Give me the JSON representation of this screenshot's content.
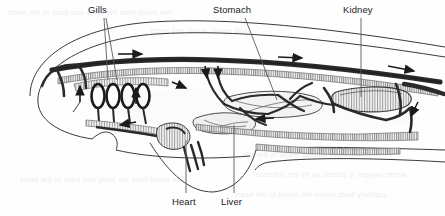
{
  "figure": {
    "background_color": "#fefefe",
    "ink_color": "#1b1b1b",
    "vessel_color": "#2a2a2a",
    "hatch_color": "#8a8a8a",
    "ghost_text_color": "#ededf0"
  },
  "labels": [
    {
      "id": "gills",
      "text": "Gills",
      "x": 88,
      "y": 5,
      "leader": "double-v"
    },
    {
      "id": "stomach",
      "text": "Stomach",
      "x": 213,
      "y": 5,
      "leader": "diagonal"
    },
    {
      "id": "kidney",
      "text": "Kidney",
      "x": 343,
      "y": 5,
      "leader": "vertical"
    },
    {
      "id": "heart",
      "text": "Heart",
      "x": 172,
      "y": 198,
      "leader": "vertical"
    },
    {
      "id": "liver",
      "text": "Liver",
      "x": 221,
      "y": 198,
      "leader": "vertical"
    }
  ],
  "flow_arrows": [
    {
      "id": "dorsal-anterior",
      "direction": "right",
      "x": 130,
      "y": 54
    },
    {
      "id": "dorsal-posterior",
      "direction": "right",
      "x": 292,
      "y": 57
    },
    {
      "id": "caudal-dorsal",
      "direction": "right",
      "x": 404,
      "y": 69
    },
    {
      "id": "gill-ascending",
      "direction": "up",
      "x": 81,
      "y": 90
    },
    {
      "id": "gill-arch-up",
      "direction": "up",
      "x": 136,
      "y": 90
    },
    {
      "id": "efferent-branch",
      "direction": "down-right",
      "x": 186,
      "y": 83
    },
    {
      "id": "hepatic-portal-a",
      "direction": "down",
      "x": 207,
      "y": 74
    },
    {
      "id": "hepatic-portal-b",
      "direction": "down",
      "x": 218,
      "y": 74
    },
    {
      "id": "ventral-return",
      "direction": "left",
      "x": 124,
      "y": 124
    },
    {
      "id": "intestinal-left",
      "direction": "left",
      "x": 258,
      "y": 118
    },
    {
      "id": "caudal-return",
      "direction": "down",
      "x": 412,
      "y": 112
    }
  ],
  "structures": [
    {
      "id": "body-outline",
      "name": "fish body outline"
    },
    {
      "id": "gill-arches",
      "name": "gill arches",
      "count": 4
    },
    {
      "id": "heart-chamber",
      "name": "heart"
    },
    {
      "id": "liver-mass",
      "name": "liver"
    },
    {
      "id": "stomach-mass",
      "name": "stomach"
    },
    {
      "id": "kidney-mass",
      "name": "kidney"
    },
    {
      "id": "dorsal-aorta",
      "name": "dorsal aorta"
    },
    {
      "id": "ventral-aorta",
      "name": "ventral aorta"
    },
    {
      "id": "pelvic-fin",
      "name": "pelvic fin"
    }
  ],
  "ghost_text": {
    "note": "faint bleed-through text from reverse of scanned page",
    "lines": [
      "the blood from the body and back to the heart",
      "and again, again and again",
      "the heart pushes blood to the gills",
      "where oxygen is picked up by the red cells",
      "capillary beds return the blood to the heart"
    ]
  }
}
